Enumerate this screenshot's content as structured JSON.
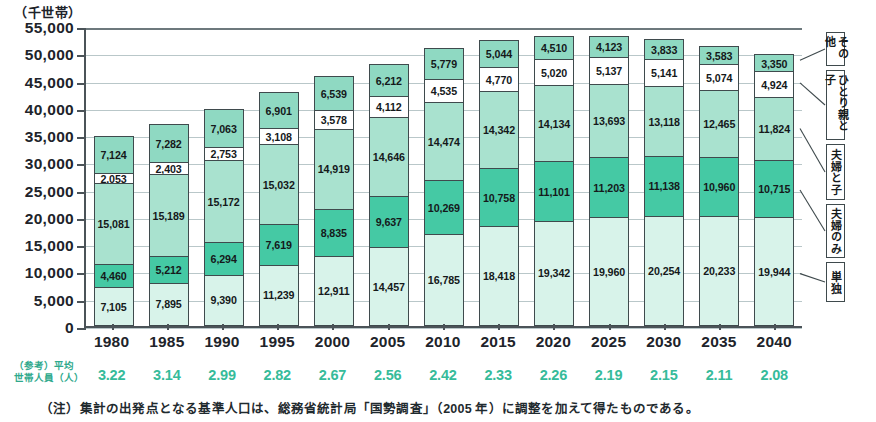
{
  "unit_caption": "（千世帯）",
  "axis": {
    "y_ticks": [
      "55,000",
      "50,000",
      "45,000",
      "40,000",
      "35,000",
      "30,000",
      "25,000",
      "20,000",
      "15,000",
      "10,000",
      "5,000",
      "0"
    ],
    "y_min": 0,
    "y_max": 55000,
    "y_step": 5000
  },
  "legend": {
    "items": [
      {
        "label": "その他",
        "color": "#8fd9c2"
      },
      {
        "label": "ひとり親と子",
        "color": "#ffffff"
      },
      {
        "label": "夫婦と子",
        "color": "#a9e2cf"
      },
      {
        "label": "夫婦のみ",
        "color": "#45c9a4"
      },
      {
        "label": "単独",
        "color": "#d8f3ea"
      }
    ]
  },
  "avg_household": {
    "caption_line1": "（参考）平均",
    "caption_line2": "世帯人員（人）",
    "values": [
      "3.22",
      "3.14",
      "2.99",
      "2.82",
      "2.67",
      "2.56",
      "2.42",
      "2.33",
      "2.26",
      "2.19",
      "2.15",
      "2.11",
      "2.08"
    ]
  },
  "footnote": "（注）集計の出発点となる基準人口は、総務省統計局「国勢調査」（2005 年）に調整を加えて得たものである。",
  "chart_data": {
    "type": "bar",
    "title": "",
    "subtitle": "",
    "xlabel": "",
    "ylabel": "（千世帯）",
    "ylim": [
      0,
      55000
    ],
    "grid": true,
    "stacked": true,
    "legend_position": "right",
    "categories": [
      "1980",
      "1985",
      "1990",
      "1995",
      "2000",
      "2005",
      "2010",
      "2015",
      "2020",
      "2025",
      "2030",
      "2035",
      "2040"
    ],
    "series": [
      {
        "name": "単独",
        "color": "#d8f3ea",
        "values": [
          7105,
          7895,
          9390,
          11239,
          12911,
          14457,
          16785,
          18418,
          19342,
          19960,
          20254,
          20233,
          19944
        ]
      },
      {
        "name": "夫婦のみ",
        "color": "#45c9a4",
        "values": [
          4460,
          5212,
          6294,
          7619,
          8835,
          9637,
          10269,
          10758,
          11101,
          11203,
          11138,
          10960,
          10715
        ]
      },
      {
        "name": "夫婦と子",
        "color": "#a9e2cf",
        "values": [
          15081,
          15189,
          15172,
          15032,
          14919,
          14646,
          14474,
          14342,
          14134,
          13693,
          13118,
          12465,
          11824
        ]
      },
      {
        "name": "ひとり親と子",
        "color": "#ffffff",
        "values": [
          2053,
          2403,
          2753,
          3108,
          3578,
          4112,
          4535,
          4770,
          5020,
          5137,
          5141,
          5074,
          4924
        ]
      },
      {
        "name": "その他",
        "color": "#8fd9c2",
        "values": [
          7124,
          7282,
          7063,
          6901,
          6539,
          6212,
          5779,
          5044,
          4510,
          4123,
          3833,
          3583,
          3350
        ]
      }
    ],
    "avg_household_members": [
      3.22,
      3.14,
      2.99,
      2.82,
      2.67,
      2.56,
      2.42,
      2.33,
      2.26,
      2.19,
      2.15,
      2.11,
      2.08
    ]
  }
}
